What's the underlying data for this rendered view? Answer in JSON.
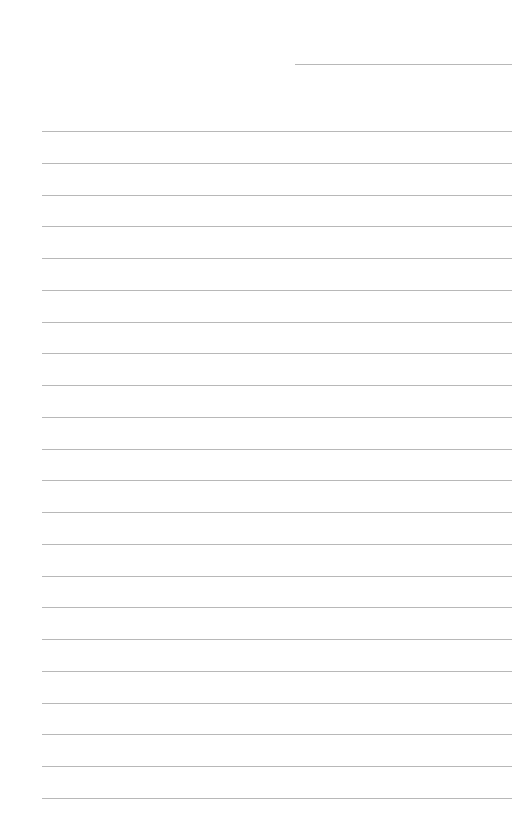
{
  "page": {
    "type": "lined-paper",
    "background_color": "#ffffff",
    "line_color": "#b8b8b8",
    "header_line": {
      "label": "",
      "left": 295,
      "top": 64,
      "width": 217
    },
    "rules": {
      "count": 22,
      "left": 42,
      "width": 470,
      "first_top": 131,
      "spacing": 31.76
    }
  }
}
